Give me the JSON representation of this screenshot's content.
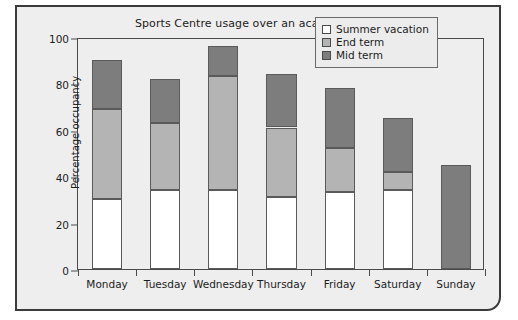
{
  "chart_data": {
    "type": "bar",
    "subtype": "stacked-vertical",
    "title": "Sports Centre usage over an academic year",
    "xlabel": "",
    "ylabel": "Percentage occupancy",
    "ylim": [
      0,
      100
    ],
    "yticks": [
      0,
      20,
      40,
      60,
      80,
      100
    ],
    "grid": false,
    "legend_position": "top-right",
    "categories": [
      "Monday",
      "Tuesday",
      "Wednesday",
      "Thursday",
      "Friday",
      "Saturday",
      "Sunday"
    ],
    "series": [
      {
        "name": "Summer vacation",
        "color": "#ffffff",
        "values": [
          30,
          34,
          34,
          31,
          33,
          34,
          0
        ]
      },
      {
        "name": "End term",
        "color": "#b4b4b4",
        "values": [
          39,
          29,
          49,
          30,
          19,
          8,
          0
        ]
      },
      {
        "name": "Mid term",
        "color": "#7d7d7d",
        "values": [
          21,
          19,
          13,
          23,
          26,
          23,
          45
        ]
      }
    ],
    "totals": [
      90,
      82,
      96,
      84,
      78,
      65,
      45
    ]
  },
  "legend": {
    "items": [
      {
        "label": "Summer vacation",
        "color": "#ffffff"
      },
      {
        "label": "End term",
        "color": "#b4b4b4"
      },
      {
        "label": "Mid term",
        "color": "#7d7d7d"
      }
    ]
  },
  "colors": {
    "figure_background": "#eeeeee",
    "frame_border": "#3a3a3a",
    "axis": "#4a4a4a",
    "text": "#1c1c1c"
  }
}
